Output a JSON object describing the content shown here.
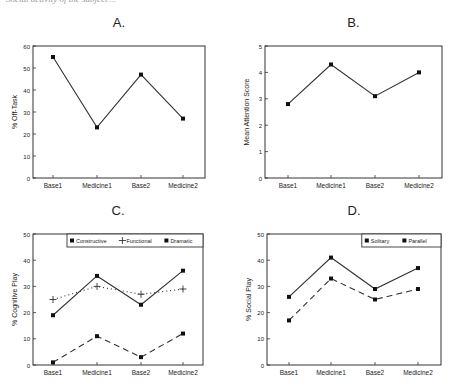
{
  "caption_cut": "Social activity of the subject ...",
  "chart_data": [
    {
      "panel": "A.",
      "type": "line",
      "title": "A.",
      "xlabel": "",
      "ylabel": "% Off-Task",
      "categories": [
        "Base1",
        "Medicine1",
        "Base2",
        "Medicine2"
      ],
      "ylim": [
        0,
        60
      ],
      "yticks": [
        0,
        10,
        20,
        30,
        40,
        50,
        60
      ],
      "grid": false,
      "legend": null,
      "series": [
        {
          "name": "Off-Task",
          "values": [
            55,
            23,
            47,
            27
          ],
          "style": "solid",
          "marker": "square"
        }
      ]
    },
    {
      "panel": "B.",
      "type": "line",
      "title": "B.",
      "xlabel": "",
      "ylabel": "Mean Attention Score",
      "categories": [
        "Base1",
        "Medicine1",
        "Base2",
        "Medicine2"
      ],
      "ylim": [
        0,
        5
      ],
      "yticks": [
        0,
        1,
        2,
        3,
        4,
        5
      ],
      "grid": false,
      "legend": null,
      "series": [
        {
          "name": "Attention",
          "values": [
            2.8,
            4.3,
            3.1,
            4.0
          ],
          "style": "solid",
          "marker": "square"
        }
      ]
    },
    {
      "panel": "C.",
      "type": "line",
      "title": "C.",
      "xlabel": "",
      "ylabel": "% Cognitive Play",
      "categories": [
        "Base1",
        "Medicine1",
        "Base2",
        "Medicine2"
      ],
      "ylim": [
        0,
        50
      ],
      "yticks": [
        0,
        10,
        20,
        30,
        40,
        50
      ],
      "grid": false,
      "legend": "top-right",
      "series": [
        {
          "name": "Constructive",
          "values": [
            19,
            34,
            23,
            36
          ],
          "style": "solid",
          "marker": "square"
        },
        {
          "name": "Functional",
          "values": [
            25,
            30,
            27,
            29
          ],
          "style": "dotted",
          "marker": "plus"
        },
        {
          "name": "Dramatic",
          "values": [
            1,
            11,
            3,
            12
          ],
          "style": "dashed",
          "marker": "square"
        }
      ]
    },
    {
      "panel": "D.",
      "type": "line",
      "title": "D.",
      "xlabel": "",
      "ylabel": "% Social Play",
      "categories": [
        "Base1",
        "Medicine1",
        "Base2",
        "Medicine2"
      ],
      "ylim": [
        0,
        50
      ],
      "yticks": [
        0,
        10,
        20,
        30,
        40,
        50
      ],
      "grid": false,
      "legend": "top-right",
      "series": [
        {
          "name": "Solitary",
          "values": [
            26,
            41,
            29,
            37
          ],
          "style": "solid",
          "marker": "square"
        },
        {
          "name": "Parallel",
          "values": [
            17,
            33,
            25,
            29
          ],
          "style": "dashed",
          "marker": "square"
        }
      ]
    }
  ],
  "layout": {
    "panels": [
      {
        "left": 33,
        "top": 46,
        "right": 205,
        "bottom": 178,
        "title_y": 27,
        "xticks": [
          53,
          97,
          141,
          183
        ]
      },
      {
        "left": 265,
        "top": 46,
        "right": 442,
        "bottom": 178,
        "title_y": 27,
        "xticks": [
          288,
          331,
          375,
          419
        ]
      },
      {
        "left": 33,
        "top": 234,
        "right": 203,
        "bottom": 365,
        "title_y": 215,
        "xticks": [
          53,
          97,
          141,
          183
        ]
      },
      {
        "left": 267,
        "top": 234,
        "right": 441,
        "bottom": 365,
        "title_y": 215,
        "xticks": [
          289,
          331,
          375,
          418
        ]
      }
    ],
    "line_color": "#333333"
  }
}
